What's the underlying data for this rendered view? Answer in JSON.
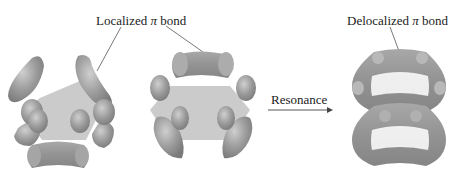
{
  "labels": {
    "localized": {
      "prefix": "Localized ",
      "symbol": "π",
      "suffix": " bond"
    },
    "delocalized": {
      "prefix": "Delocalized ",
      "symbol": "π",
      "suffix": " bond"
    },
    "resonance": "Resonance"
  },
  "structures": [
    {
      "name": "kekule-structure-1",
      "description": "benzene with three localized π bonds (left pair + bottom)"
    },
    {
      "name": "kekule-structure-2",
      "description": "benzene with three localized π bonds (top + side pairs)"
    },
    {
      "name": "delocalized-structure",
      "description": "benzene with continuous delocalized π electron rings above and below"
    }
  ],
  "colors": {
    "lobe": "#9a9a9a",
    "lobe_dark": "#7d7d7d",
    "lobe_light": "#c4c4c4",
    "ring_plane": "#b5b5b5",
    "text": "#222222",
    "leader": "#555555"
  }
}
